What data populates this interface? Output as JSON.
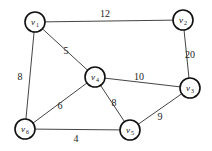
{
  "graph": {
    "type": "weighted-undirected-graph",
    "label_note": "Node subscripts are a best reading of blurry glyphs; other labelings are possible",
    "nodes": [
      {
        "id": "v1",
        "letter": "v",
        "sub": "1",
        "x": 35,
        "y": 22
      },
      {
        "id": "v2",
        "letter": "v",
        "sub": "2",
        "x": 183,
        "y": 20
      },
      {
        "id": "v4",
        "letter": "v",
        "sub": "4",
        "x": 95,
        "y": 77
      },
      {
        "id": "v3",
        "letter": "v",
        "sub": "3",
        "x": 190,
        "y": 88
      },
      {
        "id": "v6",
        "letter": "v",
        "sub": "6",
        "x": 25,
        "y": 129
      },
      {
        "id": "v5",
        "letter": "v",
        "sub": "5",
        "x": 130,
        "y": 130
      }
    ],
    "edges": [
      {
        "from": "v1",
        "to": "v2",
        "weight": "12",
        "lx": 105,
        "ly": 15
      },
      {
        "from": "v1",
        "to": "v4",
        "weight": "5",
        "lx": 66,
        "ly": 52
      },
      {
        "from": "v1",
        "to": "v6",
        "weight": "8",
        "lx": 20,
        "ly": 78
      },
      {
        "from": "v2",
        "to": "v3",
        "weight": "20",
        "lx": 190,
        "ly": 56
      },
      {
        "from": "v4",
        "to": "v3",
        "weight": "10",
        "lx": 139,
        "ly": 78
      },
      {
        "from": "v4",
        "to": "v6",
        "weight": "6",
        "lx": 60,
        "ly": 107
      },
      {
        "from": "v4",
        "to": "v5",
        "weight": "8",
        "lx": 114,
        "ly": 104
      },
      {
        "from": "v3",
        "to": "v5",
        "weight": "9",
        "lx": 160,
        "ly": 118
      },
      {
        "from": "v6",
        "to": "v5",
        "weight": "4",
        "lx": 76,
        "ly": 140
      }
    ]
  }
}
